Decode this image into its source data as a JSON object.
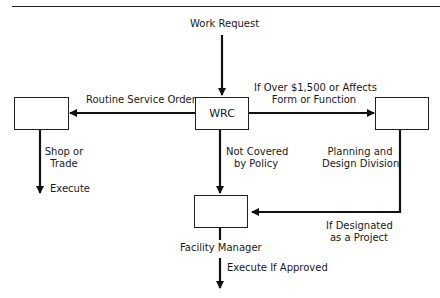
{
  "diagram": {
    "type": "flowchart",
    "nodes": {
      "work_request": "Work Request",
      "wrc": "WRC",
      "shop": "",
      "planning": "",
      "facility": ""
    },
    "labels": {
      "routine": "Routine Service Order",
      "over_line1": "If Over $1,500 or Affects",
      "over_line2": "Form or Function",
      "shop_line1": "Shop or",
      "shop_line2": "Trade",
      "execute": "Execute",
      "not_covered_line1": "Not Covered",
      "not_covered_line2": "by Policy",
      "planning_line1": "Planning and",
      "planning_line2": "Design Division",
      "designated_line1": "If Designated",
      "designated_line2": "as a Project",
      "facility_manager": "Facility Manager",
      "execute_if_approved": "Execute If Approved"
    },
    "edges": [
      {
        "from": "Work Request",
        "to": "WRC",
        "label": ""
      },
      {
        "from": "WRC",
        "to": "Shop or Trade",
        "label": "Routine Service Order"
      },
      {
        "from": "WRC",
        "to": "Planning and Design Division",
        "label": "If Over $1,500 or Affects Form or Function"
      },
      {
        "from": "WRC",
        "to": "Facility Manager",
        "label": "Not Covered by Policy"
      },
      {
        "from": "Planning and Design Division",
        "to": "Facility Manager",
        "label": "If Designated as a Project"
      },
      {
        "from": "Shop or Trade",
        "to": "end",
        "label": "Execute"
      },
      {
        "from": "Facility Manager",
        "to": "end",
        "label": "Execute If Approved"
      }
    ]
  }
}
